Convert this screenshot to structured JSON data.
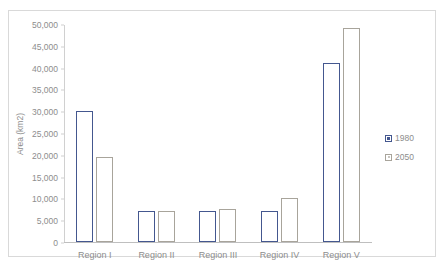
{
  "top_caption": "",
  "chart_data": {
    "type": "bar",
    "title": "",
    "xlabel": "",
    "ylabel": "Area (km2)",
    "categories": [
      "Region I",
      "Region II",
      "Region III",
      "Region IV",
      "Region V"
    ],
    "series": [
      {
        "name": "1980",
        "color": "#44578f",
        "values": [
          30000,
          7000,
          7200,
          7000,
          41000
        ]
      },
      {
        "name": "2050",
        "color": "#a8a49b",
        "values": [
          19500,
          7000,
          7500,
          10000,
          49000
        ]
      }
    ],
    "ylim": [
      0,
      50000
    ],
    "yticks": [
      0,
      5000,
      10000,
      15000,
      20000,
      25000,
      30000,
      35000,
      40000,
      45000,
      50000
    ],
    "ytick_labels": [
      "0",
      "5,000",
      "10,000",
      "15,000",
      "20,000",
      "25,000",
      "30,000",
      "35,000",
      "40,000",
      "45,000",
      "50,000"
    ],
    "grid": false,
    "legend_position": "right",
    "legend_entries": [
      "1980",
      "2050"
    ]
  }
}
